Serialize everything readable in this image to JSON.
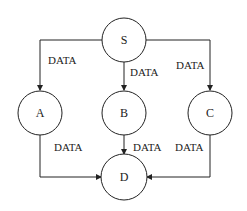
{
  "diagram": {
    "nodes": [
      {
        "id": "S",
        "label": "S"
      },
      {
        "id": "A",
        "label": "A"
      },
      {
        "id": "B",
        "label": "B"
      },
      {
        "id": "C",
        "label": "C"
      },
      {
        "id": "D",
        "label": "D"
      }
    ],
    "edges": [
      {
        "from": "S",
        "to": "A",
        "label": "DATA"
      },
      {
        "from": "S",
        "to": "B",
        "label": "DATA"
      },
      {
        "from": "S",
        "to": "C",
        "label": "DATA"
      },
      {
        "from": "A",
        "to": "D",
        "label": "DATA"
      },
      {
        "from": "B",
        "to": "D",
        "label": "DATA"
      },
      {
        "from": "C",
        "to": "D",
        "label": "DATA"
      }
    ]
  }
}
